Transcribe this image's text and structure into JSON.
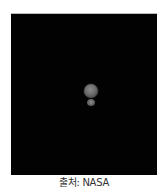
{
  "image": {
    "subject": "Pluto and Charon against black space",
    "background_color": "#020202",
    "objects": [
      {
        "name": "Pluto",
        "color": "#6b6b6b"
      },
      {
        "name": "Charon",
        "color": "#5e5e5e"
      }
    ]
  },
  "caption": {
    "text": "출처: NASA"
  }
}
